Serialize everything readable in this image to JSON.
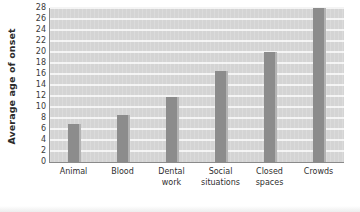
{
  "chart_data": {
    "type": "bar",
    "title": "",
    "xlabel": "",
    "ylabel": "Average age of onset",
    "ylim": [
      0,
      28
    ],
    "ytick_step": 2,
    "yticks": [
      28,
      26,
      24,
      22,
      20,
      18,
      16,
      14,
      12,
      10,
      8,
      6,
      4,
      2,
      0
    ],
    "ytick_labels": [
      "28",
      "26",
      "24",
      "22",
      "20",
      "18",
      "16",
      "14",
      "12",
      "10",
      "8",
      "6",
      "4",
      "2",
      "0"
    ],
    "categories": [
      "Animal",
      "Blood",
      "Dental work",
      "Social situations",
      "Closed spaces",
      "Crowds"
    ],
    "category_lines": [
      [
        "Animal"
      ],
      [
        "Blood"
      ],
      [
        "Dental",
        "work"
      ],
      [
        "Social",
        "situations"
      ],
      [
        "Closed",
        "spaces"
      ],
      [
        "Crowds"
      ]
    ],
    "values": [
      7,
      8.5,
      11.8,
      16.5,
      20,
      28
    ],
    "grid": true,
    "grid_orientation": "horizontal",
    "legend": false,
    "legend_position": "none",
    "colors": {
      "bar_fill": "#8c8c8c",
      "bar_edge_highlight": "#b3b3b3",
      "plot_background": "#d4d4d4",
      "gridline": "#f4f4f4",
      "axis_line": "#8a8a8a",
      "text": "#2f2f2f",
      "page_background": "#ffffff"
    }
  }
}
